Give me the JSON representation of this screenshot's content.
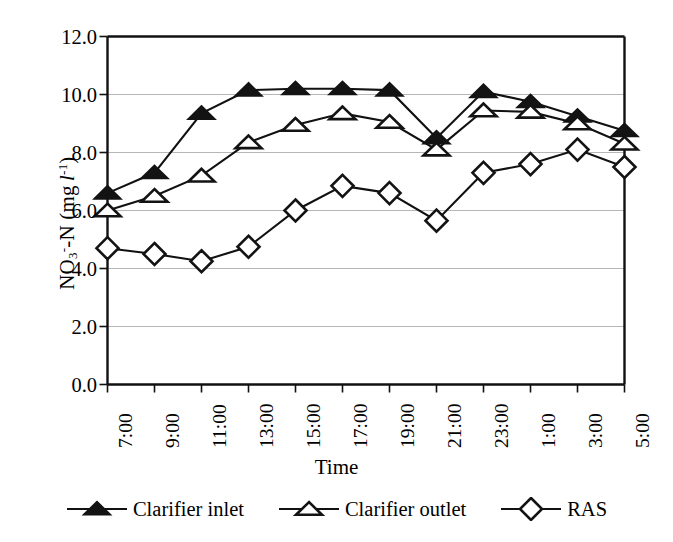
{
  "chart_data": {
    "type": "line",
    "title": "",
    "xlabel": "Time",
    "ylabel": "NO3--N (mg l-1)",
    "ylabel_parts": {
      "prefix": "NO",
      "sub": "3",
      "sup_minus": "-",
      "mid": "-N (mg ",
      "italic": "l",
      "sup_exp": "-1",
      "suffix": ")"
    },
    "categories": [
      "7:00",
      "9:00",
      "11:00",
      "13:00",
      "15:00",
      "17:00",
      "19:00",
      "21:00",
      "23:00",
      "1:00",
      "3:00",
      "5:00"
    ],
    "ylim": [
      0.0,
      12.0
    ],
    "ytick_step": 2.0,
    "yticks": [
      "12.0",
      "10.0",
      "8.0",
      "6.0",
      "4.0",
      "2.0",
      "0.0"
    ],
    "grid": "horizontal",
    "legend_position": "bottom",
    "series": [
      {
        "name": "Clarifier inlet",
        "marker": "filled-triangle",
        "color": "#131313",
        "values": [
          6.6,
          7.3,
          9.35,
          10.15,
          10.2,
          10.2,
          10.15,
          8.5,
          10.1,
          9.75,
          9.25,
          8.75
        ]
      },
      {
        "name": "Clarifier outlet",
        "marker": "open-triangle",
        "color": "#131313",
        "values": [
          6.0,
          6.5,
          7.2,
          8.35,
          8.95,
          9.35,
          9.05,
          8.1,
          9.45,
          9.4,
          9.0,
          8.3
        ]
      },
      {
        "name": "RAS",
        "marker": "open-diamond",
        "color": "#131313",
        "values": [
          4.7,
          4.5,
          4.25,
          4.75,
          6.0,
          6.85,
          6.6,
          5.65,
          7.3,
          7.6,
          8.1,
          7.5
        ]
      }
    ]
  },
  "axis": {
    "xlabel": "Time",
    "yticks": [
      "12.0",
      "10.0",
      "8.0",
      "6.0",
      "4.0",
      "2.0",
      "0.0"
    ],
    "xticks": [
      "7:00",
      "9:00",
      "11:00",
      "13:00",
      "15:00",
      "17:00",
      "19:00",
      "21:00",
      "23:00",
      "1:00",
      "3:00",
      "5:00"
    ]
  },
  "legend": {
    "items": [
      {
        "label": "Clarifier inlet",
        "marker": "filled-triangle"
      },
      {
        "label": "Clarifier outlet",
        "marker": "open-triangle"
      },
      {
        "label": "RAS",
        "marker": "open-diamond"
      }
    ]
  }
}
